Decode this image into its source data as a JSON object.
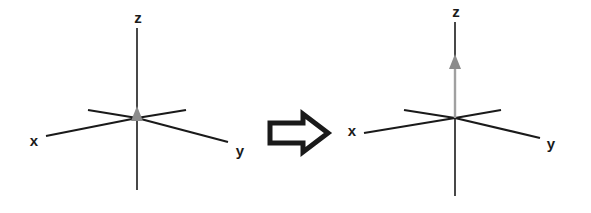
{
  "figure": {
    "title": "",
    "background_color": "#ffffff",
    "width": 591,
    "height": 213
  },
  "colors": {
    "axis_line": "#1a1a1a",
    "label_text": "#1a1a1a",
    "vector_gray": "#8c8c8c",
    "arrow_outline": "#1a1a1a",
    "arrow_fill": "#ffffff",
    "background": "#ffffff"
  },
  "panels": [
    {
      "id": "before",
      "name": "left-axes",
      "origin": {
        "x": 137,
        "y": 118
      },
      "labels": {
        "x": "x",
        "y": "y",
        "z": "z"
      },
      "label_positions": {
        "x": {
          "x": 34,
          "y": 146
        },
        "y": {
          "x": 240,
          "y": 156
        },
        "z": {
          "x": 137,
          "y": 22
        }
      },
      "axes": [
        {
          "name": "z-axis",
          "from": {
            "x": 137,
            "y": 28
          },
          "to": {
            "x": 137,
            "y": 190
          }
        },
        {
          "name": "x-axis-front",
          "from": {
            "x": 137,
            "y": 118
          },
          "to": {
            "x": 46,
            "y": 136
          }
        },
        {
          "name": "x-axis-back",
          "from": {
            "x": 137,
            "y": 118
          },
          "to": {
            "x": 185,
            "y": 110
          }
        },
        {
          "name": "y-axis-front",
          "from": {
            "x": 137,
            "y": 118
          },
          "to": {
            "x": 228,
            "y": 142
          }
        },
        {
          "name": "y-axis-back",
          "from": {
            "x": 137,
            "y": 118
          },
          "to": {
            "x": 88,
            "y": 110
          }
        }
      ],
      "vector": {
        "name": "z-vector",
        "color": "#8c8c8c",
        "from": {
          "x": 137,
          "y": 118
        },
        "to": {
          "x": 137,
          "y": 112
        },
        "magnitude_label": "",
        "present": true,
        "state": "zero"
      }
    },
    {
      "id": "after",
      "name": "right-axes",
      "origin": {
        "x": 455,
        "y": 118
      },
      "labels": {
        "x": "x",
        "y": "y",
        "z": "z"
      },
      "label_positions": {
        "x": {
          "x": 352,
          "y": 136
        },
        "y": {
          "x": 551,
          "y": 149
        },
        "z": {
          "x": 455,
          "y": 16
        }
      },
      "axes": [
        {
          "name": "z-axis",
          "from": {
            "x": 455,
            "y": 22
          },
          "to": {
            "x": 455,
            "y": 196
          }
        },
        {
          "name": "x-axis-front",
          "from": {
            "x": 455,
            "y": 118
          },
          "to": {
            "x": 364,
            "y": 133
          }
        },
        {
          "name": "x-axis-back",
          "from": {
            "x": 455,
            "y": 118
          },
          "to": {
            "x": 500,
            "y": 110
          }
        },
        {
          "name": "y-axis-front",
          "from": {
            "x": 455,
            "y": 118
          },
          "to": {
            "x": 540,
            "y": 138
          }
        },
        {
          "name": "y-axis-back",
          "from": {
            "x": 455,
            "y": 118
          },
          "to": {
            "x": 404,
            "y": 110
          }
        }
      ],
      "vector": {
        "name": "z-vector",
        "color": "#8c8c8c",
        "from": {
          "x": 455,
          "y": 118
        },
        "to": {
          "x": 455,
          "y": 58
        },
        "magnitude_label": "",
        "present": true,
        "state": "extended"
      }
    }
  ],
  "transition_arrow": {
    "name": "transition-arrow",
    "direction": "right",
    "style": "hollow-block",
    "outline_color": "#1a1a1a",
    "fill_color": "#ffffff",
    "bounds": {
      "x": 268,
      "y": 114,
      "width": 60,
      "height": 38
    }
  }
}
